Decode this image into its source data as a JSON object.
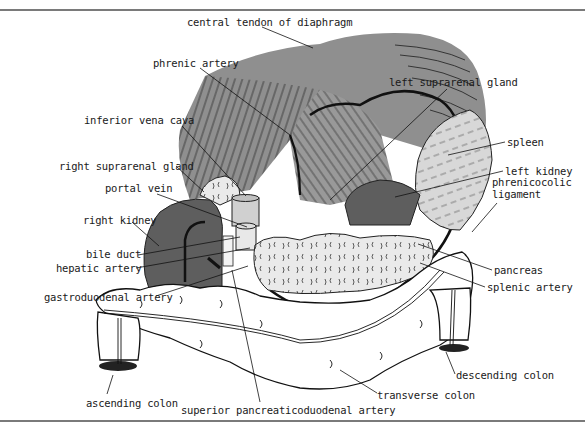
{
  "figure": {
    "type": "anatomical illustration",
    "colors": {
      "diaphragm": "#8f8f8f",
      "diaphragm_light": "#a8a8a8",
      "kidney": "#5e5e5e",
      "spleen": "#d6d6d6",
      "pancreas": "#e8e8e8",
      "colon": "#ffffff",
      "ink": "#111111",
      "rule": "#7a7a7a"
    }
  },
  "labels": [
    {
      "id": "central-tendon",
      "text": "central tendon of diaphragm",
      "x": 187,
      "y": 16,
      "ax": 313,
      "ay": 48,
      "lx": 262,
      "ly": 27
    },
    {
      "id": "phrenic-artery",
      "text": "phrenic artery",
      "x": 153,
      "y": 57,
      "ax": 290,
      "ay": 135,
      "lx": 200,
      "ly": 68
    },
    {
      "id": "left-suprarenal-gland",
      "text": "left suprarenal gland",
      "x": 389,
      "y": 76,
      "ax": 330,
      "ay": 200,
      "lx": 447,
      "ly": 89
    },
    {
      "id": "inferior-vena-cava",
      "text": "inferior vena cava",
      "x": 84,
      "y": 114,
      "ax": 246,
      "ay": 196,
      "lx": 182,
      "ly": 126
    },
    {
      "id": "spleen",
      "text": "spleen",
      "x": 507,
      "y": 136,
      "ax": 448,
      "ay": 155,
      "lx": 505,
      "ly": 142
    },
    {
      "id": "right-suprarenal-gland",
      "text": "right suprarenal gland",
      "x": 59,
      "y": 160,
      "ax": 204,
      "ay": 192,
      "lx": 176,
      "ly": 166
    },
    {
      "id": "left-kidney",
      "text": "left kidney",
      "x": 505,
      "y": 165,
      "ax": 395,
      "ay": 197,
      "lx": 503,
      "ly": 171
    },
    {
      "id": "portal-vein",
      "text": "portal vein",
      "x": 105,
      "y": 182,
      "ax": 247,
      "ay": 227,
      "lx": 157,
      "ly": 194
    },
    {
      "id": "phrenicocolic-ligament",
      "text": "phrenicocolic\nligament",
      "x": 492,
      "y": 176,
      "ax": 472,
      "ay": 232,
      "lx": 497,
      "ly": 203
    },
    {
      "id": "right-kidney",
      "text": "right kidney",
      "x": 83,
      "y": 214,
      "ax": 159,
      "ay": 246,
      "lx": 132,
      "ly": 222
    },
    {
      "id": "bile-duct",
      "text": "bile duct",
      "x": 86,
      "y": 248,
      "ax": 240,
      "ay": 237,
      "lx": 138,
      "ly": 255
    },
    {
      "id": "hepatic-artery",
      "text": "hepatic artery",
      "x": 56,
      "y": 262,
      "ax": 250,
      "ay": 248,
      "lx": 136,
      "ly": 268
    },
    {
      "id": "pancreas",
      "text": "pancreas",
      "x": 494,
      "y": 264,
      "ax": 418,
      "ay": 244,
      "lx": 492,
      "ly": 270
    },
    {
      "id": "splenic-artery",
      "text": "splenic artery",
      "x": 487,
      "y": 281,
      "ax": 420,
      "ay": 263,
      "lx": 485,
      "ly": 287
    },
    {
      "id": "gastroduodenal-artery",
      "text": "gastroduodenal artery",
      "x": 44,
      "y": 291,
      "ax": 248,
      "ay": 266,
      "lx": 156,
      "ly": 296
    },
    {
      "id": "descending-colon",
      "text": "descending colon",
      "x": 456,
      "y": 369,
      "ax": 446,
      "ay": 352,
      "lx": 455,
      "ly": 374
    },
    {
      "id": "ascending-colon",
      "text": "ascending colon",
      "x": 86,
      "y": 397,
      "ax": 113,
      "ay": 375,
      "lx": 107,
      "ly": 394
    },
    {
      "id": "transverse-colon",
      "text": "transverse colon",
      "x": 377,
      "y": 389,
      "ax": 340,
      "ay": 370,
      "lx": 377,
      "ly": 393
    },
    {
      "id": "superior-pancreaticoduodenal-artery",
      "text": "superior pancreaticoduodenal artery",
      "x": 181,
      "y": 404,
      "ax": 232,
      "ay": 270,
      "lx": 260,
      "ly": 402
    }
  ]
}
